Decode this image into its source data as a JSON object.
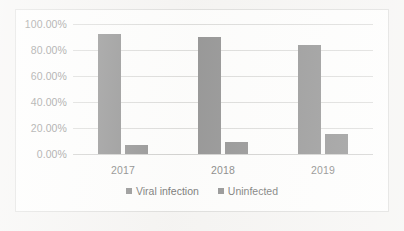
{
  "chart_data": {
    "type": "bar",
    "title": "",
    "xlabel": "",
    "ylabel": "",
    "categories": [
      "2017",
      "2018",
      "2019"
    ],
    "series": [
      {
        "name": "Viral infection",
        "values": [
          92.0,
          90.0,
          84.0
        ],
        "color": "#808080"
      },
      {
        "name": "Uninfected",
        "values": [
          7.0,
          9.5,
          15.5
        ],
        "color": "#808080"
      }
    ],
    "ylim": [
      0,
      100
    ],
    "ytick_values": [
      100,
      80,
      60,
      40,
      20,
      0
    ],
    "ytick_labels": [
      "100.00%",
      "80.00%",
      "60.00%",
      "40.00%",
      "20.00%",
      "0.00%"
    ],
    "grid": true,
    "legend_position": "bottom",
    "value_format": "percent"
  },
  "legend": {
    "items": [
      {
        "label": "Viral infection"
      },
      {
        "label": "Uninfected"
      }
    ]
  },
  "colors": {
    "bar": "#808080",
    "gridline": "#d6d6d4",
    "frame_border": "#d9d9d7",
    "plot_background": "#fdfdfc",
    "page_background": "#f4f3f1",
    "tick_text": "#7b7b79"
  }
}
